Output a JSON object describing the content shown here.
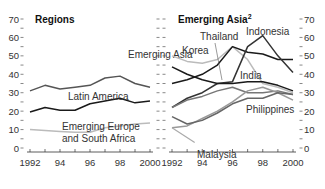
{
  "chart_data": [
    {
      "type": "line",
      "title": "Regions",
      "x": [
        1992,
        1993,
        1994,
        1995,
        1996,
        1997,
        1998,
        1999,
        2000
      ],
      "xticks": [
        "1992",
        "94",
        "96",
        "98",
        "2000"
      ],
      "yticks": [
        "0",
        "10",
        "20",
        "30",
        "40",
        "50",
        "60",
        "70"
      ],
      "ylim": [
        0,
        70
      ],
      "xlabel": "",
      "ylabel": "",
      "series": [
        {
          "name": "Emerging Asia",
          "color": "#555555",
          "values": [
            31,
            34,
            32,
            33,
            34,
            38,
            39,
            35,
            33
          ]
        },
        {
          "name": "Latin America",
          "color": "#1a1a1a",
          "values": [
            19.5,
            22,
            20.5,
            20.5,
            24,
            25.5,
            27,
            24.5,
            25.5
          ]
        },
        {
          "name": "Emerging Europe and South Africa",
          "color": "#bbbbbb",
          "values": [
            10,
            9.5,
            9,
            8.5,
            8.5,
            11,
            12,
            13,
            13.5
          ]
        }
      ],
      "annotations": [
        "Emerging Asia",
        "Latin America",
        "Emerging Europe",
        "and South Africa"
      ]
    },
    {
      "type": "line",
      "title": "Emerging Asia",
      "title_superscript": "2",
      "x": [
        1992,
        1993,
        1994,
        1995,
        1996,
        1997,
        1998,
        1999,
        2000
      ],
      "xticks": [
        "1992",
        "94",
        "96",
        "98",
        "2000"
      ],
      "yticks": [
        "0",
        "10",
        "20",
        "30",
        "40",
        "50",
        "60",
        "70"
      ],
      "ylim": [
        0,
        70
      ],
      "xlabel": "",
      "ylabel": "",
      "series": [
        {
          "name": "Korea",
          "color": "#bbbbbb",
          "values": [
            50,
            47,
            46,
            48,
            55,
            48,
            35,
            33,
            30
          ]
        },
        {
          "name": "Thailand",
          "color": "#1a1a1a",
          "values": [
            35,
            37,
            40,
            45,
            55,
            52,
            51,
            48,
            48
          ]
        },
        {
          "name": "Indonesia",
          "color": "#333333",
          "values": [
            22,
            27,
            30,
            35,
            36,
            55,
            61,
            50,
            41
          ]
        },
        {
          "name": "India",
          "color": "#1a1a1a",
          "values": [
            44,
            40,
            37,
            35,
            35,
            36,
            36,
            34,
            31
          ]
        },
        {
          "name": "Philippines",
          "color": "#777777",
          "values": [
            22,
            26,
            28,
            31,
            33,
            30,
            30,
            31,
            29
          ]
        },
        {
          "name": "Malaysia",
          "color": "#999999",
          "values": [
            11,
            12,
            16,
            20,
            25,
            31,
            33,
            30,
            26
          ]
        },
        {
          "name": "Other",
          "color": "#666666",
          "values": [
            17,
            13,
            15,
            19,
            24,
            27,
            27,
            30,
            29
          ]
        },
        {
          "name": "Malaysia-low",
          "color": "#aaaaaa",
          "values": [
            11,
            6,
            0
          ]
        }
      ],
      "annotations": [
        "Korea",
        "Thailand",
        "Indonesia",
        "India",
        "Philippines",
        "Malaysia"
      ]
    }
  ]
}
